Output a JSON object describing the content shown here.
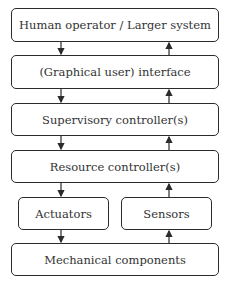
{
  "diagram": {
    "boxes": [
      {
        "id": "human",
        "label": "Human operator / Larger system"
      },
      {
        "id": "interface",
        "label": "(Graphical user) interface"
      },
      {
        "id": "supervisory",
        "label": "Supervisory controller(s)"
      },
      {
        "id": "resource",
        "label": "Resource controller(s)"
      },
      {
        "id": "actuators",
        "label": "Actuators"
      },
      {
        "id": "sensors",
        "label": "Sensors"
      },
      {
        "id": "mechanical",
        "label": "Mechanical components"
      }
    ],
    "edges": [
      {
        "from": "human",
        "to": "interface",
        "direction": "down"
      },
      {
        "from": "interface",
        "to": "human",
        "direction": "up"
      },
      {
        "from": "interface",
        "to": "supervisory",
        "direction": "down"
      },
      {
        "from": "supervisory",
        "to": "interface",
        "direction": "up"
      },
      {
        "from": "supervisory",
        "to": "resource",
        "direction": "down"
      },
      {
        "from": "resource",
        "to": "supervisory",
        "direction": "up"
      },
      {
        "from": "resource",
        "to": "actuators",
        "direction": "down"
      },
      {
        "from": "sensors",
        "to": "resource",
        "direction": "up"
      },
      {
        "from": "actuators",
        "to": "mechanical",
        "direction": "down"
      },
      {
        "from": "mechanical",
        "to": "sensors",
        "direction": "up"
      }
    ]
  }
}
